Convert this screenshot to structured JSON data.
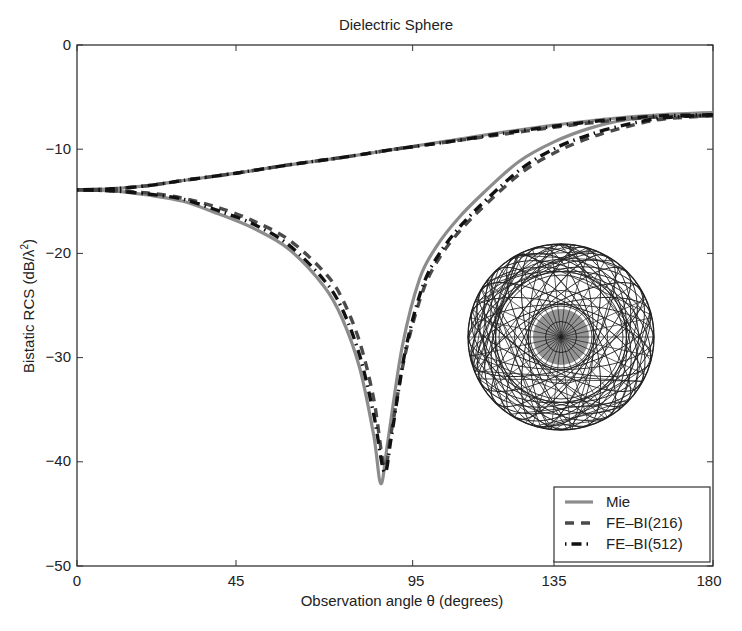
{
  "chart_data": {
    "type": "line",
    "title": "Dielectric Sphere",
    "xlabel": "Observation angle θ (degrees)",
    "ylabel": "Bistatic RCS (dB/λ²)",
    "xlim": [
      0,
      180
    ],
    "ylim": [
      -50,
      0
    ],
    "xticks": [
      0,
      45,
      95,
      135,
      180
    ],
    "yticks": [
      0,
      -10,
      -20,
      -30,
      -40,
      -50
    ],
    "grid": false,
    "legend_position": "lower right",
    "inset": "sphere-tetrahedral-mesh-wireframe",
    "series": [
      {
        "name": "Mie",
        "style": "solid",
        "color": "#8c8c8c",
        "width": 3.2,
        "curves": [
          {
            "label": "upper (co-pol, E-plane/H-plane)",
            "x": [
              0,
              10,
              20,
              30,
              45,
              60,
              75,
              90,
              105,
              120,
              135,
              150,
              165,
              180
            ],
            "y": [
              -13.9,
              -13.8,
              -13.5,
              -13.0,
              -12.3,
              -11.5,
              -10.8,
              -10.0,
              -9.2,
              -8.4,
              -7.7,
              -7.1,
              -6.7,
              -6.5
            ]
          },
          {
            "label": "lower (with null)",
            "x": [
              0,
              10,
              20,
              30,
              40,
              50,
              60,
              70,
              75,
              80,
              84,
              86,
              88,
              92,
              97,
              102,
              108,
              115,
              125,
              135,
              145,
              155,
              165,
              180
            ],
            "y": [
              -13.9,
              -14.0,
              -14.4,
              -15.0,
              -16.2,
              -17.6,
              -19.6,
              -23.2,
              -26.2,
              -31.0,
              -37.5,
              -42.1,
              -38.0,
              -29.0,
              -22.4,
              -19.2,
              -16.6,
              -14.2,
              -11.2,
              -9.3,
              -8.0,
              -7.2,
              -6.8,
              -6.5
            ]
          }
        ]
      },
      {
        "name": "FE-BI(216)",
        "style": "dashed",
        "color": "#4a4a4a",
        "width": 3.4,
        "curves": [
          {
            "label": "upper",
            "x": [
              0,
              10,
              20,
              30,
              45,
              60,
              75,
              90,
              105,
              120,
              135,
              150,
              165,
              180
            ],
            "y": [
              -13.9,
              -13.8,
              -13.5,
              -13.0,
              -12.3,
              -11.5,
              -10.8,
              -10.0,
              -9.3,
              -8.6,
              -7.9,
              -7.3,
              -6.9,
              -6.8
            ]
          },
          {
            "label": "lower",
            "x": [
              0,
              10,
              20,
              30,
              40,
              50,
              60,
              70,
              75,
              80,
              84,
              87,
              89,
              93,
              98,
              103,
              109,
              116,
              126,
              136,
              146,
              156,
              166,
              180
            ],
            "y": [
              -13.9,
              -14.0,
              -14.2,
              -14.7,
              -15.6,
              -16.9,
              -18.7,
              -21.8,
              -24.3,
              -28.5,
              -34.0,
              -40.5,
              -37.0,
              -29.5,
              -23.5,
              -20.2,
              -17.6,
              -15.2,
              -12.2,
              -10.2,
              -8.8,
              -7.8,
              -7.1,
              -6.8
            ]
          }
        ]
      },
      {
        "name": "FE-BI(512)",
        "style": "dash-dot",
        "color": "#111111",
        "width": 3.4,
        "curves": [
          {
            "label": "upper",
            "x": [
              0,
              10,
              20,
              30,
              45,
              60,
              75,
              90,
              105,
              120,
              135,
              150,
              165,
              180
            ],
            "y": [
              -13.9,
              -13.8,
              -13.5,
              -13.0,
              -12.3,
              -11.5,
              -10.8,
              -10.0,
              -9.3,
              -8.5,
              -7.8,
              -7.2,
              -6.8,
              -6.7
            ]
          },
          {
            "label": "lower",
            "x": [
              0,
              10,
              20,
              30,
              40,
              50,
              60,
              70,
              75,
              80,
              84,
              87,
              89,
              93,
              98,
              103,
              109,
              116,
              126,
              136,
              146,
              156,
              166,
              180
            ],
            "y": [
              -13.9,
              -14.0,
              -14.3,
              -14.8,
              -15.9,
              -17.2,
              -19.2,
              -22.6,
              -25.3,
              -29.8,
              -35.5,
              -41.0,
              -37.5,
              -29.2,
              -23.0,
              -19.8,
              -17.2,
              -14.8,
              -11.8,
              -9.8,
              -8.5,
              -7.6,
              -7.0,
              -6.7
            ]
          }
        ]
      }
    ]
  },
  "legend": {
    "items": [
      {
        "label": "Mie"
      },
      {
        "label": "FE–BI(216)"
      },
      {
        "label": "FE–BI(512)"
      }
    ]
  },
  "axes": {
    "title": "Dielectric Sphere",
    "xlabel": "Observation angle θ (degrees)",
    "ylabel_main": "Bistatic RCS (dB/λ",
    "ylabel_sup": "2",
    "ylabel_end": ")",
    "xtick_labels": [
      "0",
      "45",
      "95",
      "135",
      "180"
    ],
    "ytick_labels": [
      "0",
      "−10",
      "−20",
      "−30",
      "−40",
      "−50"
    ]
  }
}
